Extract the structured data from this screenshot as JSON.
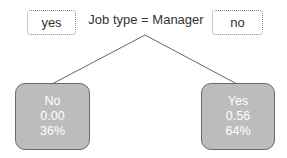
{
  "split": {
    "label": "Job type = Manager",
    "yes_label": "yes",
    "no_label": "no"
  },
  "nodes": [
    {
      "class": "No",
      "value": "0.00",
      "percent": "36%"
    },
    {
      "class": "Yes",
      "value": "0.56",
      "percent": "64%"
    }
  ],
  "colors": {
    "node_fill": "#bcbcbc",
    "node_border": "#6a6a6a",
    "node_text": "#ffffff",
    "edge": "#666666"
  }
}
